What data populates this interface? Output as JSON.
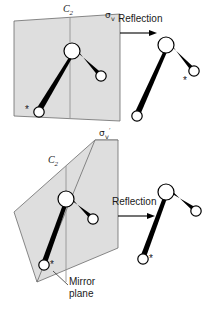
{
  "figure": {
    "panels": [
      {
        "id": "top",
        "plane_label": "sigma-v",
        "plane_label_text": "σ",
        "plane_label_sub": "v",
        "axis_label_text": "C",
        "axis_label_sub": "2",
        "operation_label": "Reflection"
      },
      {
        "id": "bottom",
        "plane_label": "sigma-v-prime",
        "plane_label_text": "σ",
        "plane_label_sub": "v",
        "plane_label_prime": "′",
        "axis_label_text": "C",
        "axis_label_sub": "2",
        "operation_label": "Reflection",
        "callout_line1": "Mirror",
        "callout_line2": "plane"
      }
    ],
    "atom_marker": "*",
    "colors": {
      "plane_fill": "#dedede",
      "plane_stroke": "#6b6b6b",
      "bond": "#000000",
      "atom_fill": "#ffffff",
      "atom_stroke": "#000000",
      "text": "#1a1a1a",
      "background": "#ffffff"
    },
    "molecules": [
      {
        "id": "top-left",
        "description": "bent triatomic molecule inside sigma-v plane, starred atom lower-left",
        "center": [
          72,
          51
        ],
        "atom_a": [
          39,
          112
        ],
        "atom_b": [
          101,
          76
        ],
        "star_at": "atom_a",
        "star_side": "left"
      },
      {
        "id": "top-right",
        "description": "reflected molecule, starred atom now upper-right",
        "center": [
          166,
          45
        ],
        "atom_a": [
          137,
          116
        ],
        "atom_b": [
          194,
          71
        ],
        "star_at": "atom_b",
        "star_side": "below"
      },
      {
        "id": "bottom-left",
        "description": "bent triatomic molecule in sigma-v-prime plane, starred atom lower-left",
        "center": [
          66,
          199
        ],
        "atom_a": [
          44,
          265
        ],
        "atom_b": [
          93,
          219
        ],
        "star_at": "atom_a",
        "star_side": "right"
      },
      {
        "id": "bottom-right",
        "description": "molecule unchanged by reflection, starred atom lower-left",
        "center": [
          166,
          192
        ],
        "atom_a": [
          143,
          259
        ],
        "atom_b": [
          196,
          211
        ],
        "star_at": "atom_a",
        "star_side": "right"
      }
    ]
  }
}
